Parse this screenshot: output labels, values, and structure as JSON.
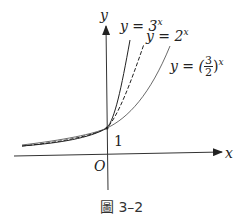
{
  "figure": {
    "axis_x_label": "x",
    "axis_y_label": "y",
    "origin_label": "O",
    "intercept_label": "1",
    "curves": [
      {
        "base": "3",
        "label_prefix": "y = 3",
        "exponent": "x",
        "style": "solid"
      },
      {
        "base": "2",
        "label_prefix": "y = 2",
        "exponent": "x",
        "style": "dashed"
      },
      {
        "base": "3/2",
        "label_prefix": "y = (",
        "frac_num": "3",
        "frac_den": "2",
        "label_suffix": ")",
        "exponent": "x",
        "style": "solid-thin"
      }
    ],
    "caption": "圖 3–2"
  }
}
